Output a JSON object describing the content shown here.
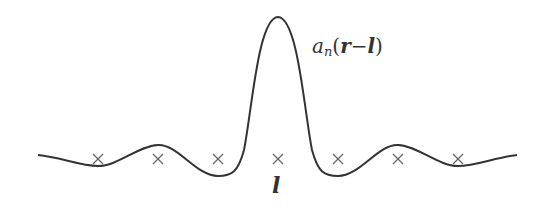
{
  "diagram": {
    "type": "wannier-function-plot",
    "function_label": {
      "symbol": "a",
      "subscript": "n",
      "open": "(",
      "arg1": "r",
      "op": "−",
      "arg2": "l",
      "close": ")"
    },
    "center_site_label": "l",
    "lattice_sites": [
      {
        "x": 98,
        "y": 159,
        "marker": "×"
      },
      {
        "x": 158,
        "y": 159,
        "marker": "×"
      },
      {
        "x": 218,
        "y": 159,
        "marker": "×"
      },
      {
        "x": 278,
        "y": 159,
        "marker": "×"
      },
      {
        "x": 338,
        "y": 159,
        "marker": "×"
      },
      {
        "x": 398,
        "y": 159,
        "marker": "×"
      },
      {
        "x": 458,
        "y": 159,
        "marker": "×"
      }
    ],
    "colors": {
      "curve": "#333333",
      "markers": "#666666",
      "text": "#333333"
    }
  }
}
